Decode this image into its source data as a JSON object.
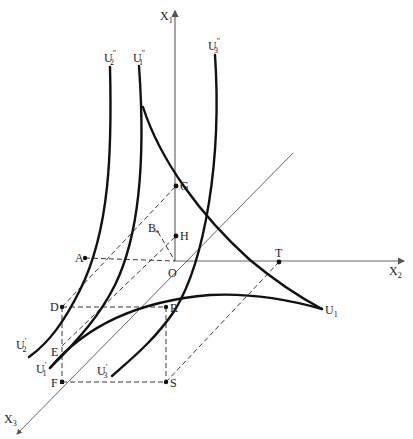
{
  "figure": {
    "type": "3D indifference / utility surface diagram",
    "axes": {
      "x1": {
        "label": "X",
        "sub": "1"
      },
      "x2": {
        "label": "X",
        "sub": "2"
      },
      "x3": {
        "label": "X",
        "sub": "3"
      }
    },
    "origin": {
      "label": "O"
    },
    "points": [
      {
        "id": "G",
        "label": "G"
      },
      {
        "id": "H",
        "label": "H"
      },
      {
        "id": "A",
        "label": "A"
      },
      {
        "id": "B",
        "label": "B"
      },
      {
        "id": "T",
        "label": "T"
      },
      {
        "id": "D",
        "label": "D"
      },
      {
        "id": "R",
        "label": "R"
      },
      {
        "id": "E",
        "label": "E"
      },
      {
        "id": "F",
        "label": "F"
      },
      {
        "id": "S",
        "label": "S"
      }
    ],
    "curves": [
      {
        "id": "U1",
        "label": "U",
        "sub": "1",
        "prime": ""
      },
      {
        "id": "U1pp",
        "label": "U",
        "sub": "1",
        "prime": "″"
      },
      {
        "id": "U2pp",
        "label": "U",
        "sub": "2",
        "prime": "″"
      },
      {
        "id": "U3pp",
        "label": "U",
        "sub": "3",
        "prime": "″"
      },
      {
        "id": "U1p",
        "label": "U",
        "sub": "1",
        "prime": "′"
      },
      {
        "id": "U2p",
        "label": "U",
        "sub": "2",
        "prime": "′"
      },
      {
        "id": "U3p",
        "label": "U",
        "sub": "3",
        "prime": "′"
      }
    ]
  }
}
